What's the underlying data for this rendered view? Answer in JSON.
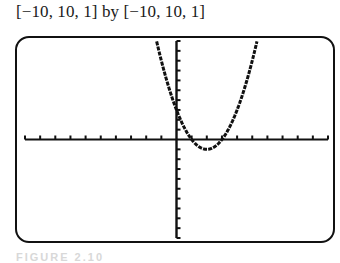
{
  "window": {
    "label": "[−10, 10, 1] by [−10, 10, 1]",
    "xmin": -10,
    "xmax": 10,
    "xscl": 1,
    "ymin": -10,
    "ymax": 10,
    "yscl": 1
  },
  "caption": "FIGURE 2.10",
  "chart_data": {
    "type": "line",
    "title": "[−10, 10, 1] by [−10, 10, 1]",
    "xlabel": "",
    "ylabel": "",
    "xlim": [
      -10,
      10
    ],
    "ylim": [
      -10,
      10
    ],
    "x_tick_step": 1,
    "y_tick_step": 1,
    "grid": false,
    "legend": "none",
    "series": [
      {
        "name": "y = x^2 - 4x + 3",
        "coefficients": {
          "a": 1,
          "b": -4,
          "c": 3
        },
        "x": [
          -1.32,
          -1,
          0,
          1,
          2,
          3,
          4,
          5,
          5.32
        ],
        "y": [
          10,
          8,
          3,
          0,
          -1,
          0,
          3,
          8,
          10
        ]
      }
    ],
    "annotations": {
      "roots": [
        1,
        3
      ],
      "vertex": [
        2,
        -1
      ],
      "y_intercept": 3
    }
  }
}
